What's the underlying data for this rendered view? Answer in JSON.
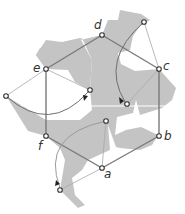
{
  "diagram": {
    "type": "geometric-tiling-rotation",
    "colors": {
      "shape_fill": "#c4c4c4",
      "hexagon_stroke": "#7a7a7a",
      "thin_line": "#a8a8a8",
      "arc": "#6f6f6f",
      "point_stroke": "#333333",
      "label": "#333333"
    },
    "labels": {
      "a": "a",
      "b": "b",
      "c": "c",
      "d": "d",
      "e": "e",
      "f": "f"
    },
    "vertices": {
      "a": [
        102,
        168
      ],
      "b": [
        159,
        136
      ],
      "c": [
        159,
        69
      ],
      "d": [
        102,
        35
      ],
      "e": [
        46,
        69
      ],
      "f": [
        46,
        136
      ]
    },
    "rotated_points": {
      "top_right": [
        144,
        22
      ],
      "left": [
        6,
        96
      ],
      "bottom_left": [
        60,
        190
      ],
      "inner_e": [
        90,
        90
      ],
      "inner_c": [
        127,
        104
      ],
      "inner_a": [
        106,
        121
      ]
    }
  }
}
